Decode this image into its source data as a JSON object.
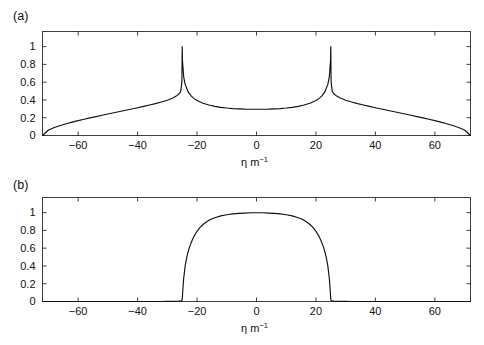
{
  "figure": {
    "width": 484,
    "height": 345,
    "background": "#ffffff",
    "line_color": "#111111",
    "axis_color": "#2b2b2b"
  },
  "panels": [
    {
      "id": "a",
      "label": "(a)",
      "xlabel_symbol": "η m",
      "xlabel_exponent": "−1",
      "xticks": [
        -60,
        -40,
        -20,
        0,
        20,
        40,
        60
      ],
      "xticklabels": [
        "−60",
        "−40",
        "−20",
        "0",
        "20",
        "40",
        "60"
      ],
      "yticks": [
        0,
        0.2,
        0.4,
        0.6,
        0.8,
        1
      ],
      "yticklabels": [
        "0",
        "0.2",
        "0.4",
        "0.6",
        "0.8",
        "1"
      ],
      "xlim": [
        -72,
        72
      ],
      "ylim": [
        0,
        1.17
      ]
    },
    {
      "id": "b",
      "label": "(b)",
      "xlabel_symbol": "η m",
      "xlabel_exponent": "−1",
      "xticks": [
        -60,
        -40,
        -20,
        0,
        20,
        40,
        60
      ],
      "xticklabels": [
        "−60",
        "−40",
        "−20",
        "0",
        "20",
        "40",
        "60"
      ],
      "yticks": [
        0,
        0.2,
        0.4,
        0.6,
        0.8,
        1
      ],
      "yticklabels": [
        "0",
        "0.2",
        "0.4",
        "0.6",
        "0.8",
        "1"
      ],
      "xlim": [
        -72,
        72
      ],
      "ylim": [
        0,
        1.17
      ]
    }
  ],
  "chart_data": [
    {
      "type": "line",
      "title": "(a)",
      "xlabel": "η m⁻¹",
      "ylabel": "",
      "xlim": [
        -72,
        72
      ],
      "ylim": [
        0,
        1.17
      ],
      "grid": false,
      "legend": null,
      "xticks": [
        -60,
        -40,
        -20,
        0,
        20,
        40,
        60
      ],
      "yticks": [
        0,
        0.2,
        0.4,
        0.6,
        0.8,
        1
      ],
      "annotations": [
        "cusp singularities at η = ±25 reaching 1",
        "zero at η = ±72",
        "central plateau near 0.30"
      ],
      "x": [
        -72,
        -70,
        -68,
        -66,
        -64,
        -62,
        -60,
        -58,
        -56,
        -54,
        -52,
        -50,
        -48,
        -46,
        -44,
        -42,
        -40,
        -38,
        -36,
        -34,
        -32,
        -30,
        -28,
        -27,
        -26,
        -25.5,
        -25.1,
        -25,
        -24.9,
        -24.5,
        -24,
        -23,
        -22,
        -21,
        -20,
        -18,
        -16,
        -14,
        -12,
        -10,
        -8,
        -6,
        -4,
        -2,
        0,
        2,
        4,
        6,
        8,
        10,
        12,
        14,
        16,
        18,
        20,
        21,
        22,
        23,
        24,
        24.5,
        24.9,
        25,
        25.1,
        25.5,
        26,
        27,
        28,
        30,
        32,
        34,
        36,
        38,
        40,
        42,
        44,
        46,
        48,
        50,
        52,
        54,
        56,
        58,
        60,
        62,
        64,
        66,
        68,
        70,
        72
      ],
      "y": [
        0,
        0.062,
        0.09,
        0.112,
        0.132,
        0.15,
        0.167,
        0.183,
        0.198,
        0.213,
        0.228,
        0.242,
        0.256,
        0.27,
        0.284,
        0.298,
        0.312,
        0.327,
        0.343,
        0.359,
        0.377,
        0.397,
        0.424,
        0.443,
        0.47,
        0.496,
        0.6,
        1.0,
        0.84,
        0.66,
        0.575,
        0.49,
        0.445,
        0.415,
        0.393,
        0.363,
        0.343,
        0.328,
        0.317,
        0.309,
        0.303,
        0.299,
        0.296,
        0.295,
        0.295,
        0.295,
        0.296,
        0.299,
        0.303,
        0.309,
        0.317,
        0.328,
        0.343,
        0.363,
        0.393,
        0.415,
        0.445,
        0.49,
        0.575,
        0.66,
        0.84,
        1.0,
        0.6,
        0.496,
        0.47,
        0.443,
        0.424,
        0.397,
        0.377,
        0.359,
        0.343,
        0.327,
        0.312,
        0.298,
        0.284,
        0.27,
        0.256,
        0.242,
        0.228,
        0.213,
        0.198,
        0.183,
        0.167,
        0.15,
        0.132,
        0.112,
        0.09,
        0.062,
        0
      ]
    },
    {
      "type": "line",
      "title": "(b)",
      "xlabel": "η m⁻¹",
      "ylabel": "",
      "xlim": [
        -72,
        72
      ],
      "ylim": [
        0,
        1.17
      ],
      "grid": false,
      "legend": null,
      "xticks": [
        -60,
        -40,
        -20,
        0,
        20,
        40,
        60
      ],
      "yticks": [
        0,
        0.2,
        0.4,
        0.6,
        0.8,
        1
      ],
      "annotations": [
        "flat-top profile, zero outside |η| > 25",
        "sharp near-vertical edges at η = ±25",
        "maximum 1 at η = 0"
      ],
      "x": [
        -72,
        -65,
        -60,
        -55,
        -50,
        -45,
        -40,
        -35,
        -32,
        -30,
        -28,
        -27,
        -26,
        -25.5,
        -25.2,
        -25,
        -24.8,
        -24.5,
        -24,
        -23.5,
        -23,
        -22.5,
        -22,
        -21.5,
        -21,
        -20,
        -19,
        -18,
        -17,
        -16,
        -15,
        -14,
        -12,
        -10,
        -8,
        -6,
        -4,
        -2,
        0,
        2,
        4,
        6,
        8,
        10,
        12,
        14,
        15,
        16,
        17,
        18,
        19,
        20,
        21,
        21.5,
        22,
        22.5,
        23,
        23.5,
        24,
        24.5,
        24.8,
        25,
        25.2,
        25.5,
        26,
        27,
        28,
        30,
        32,
        35,
        40,
        45,
        50,
        55,
        60,
        65,
        72
      ],
      "y": [
        0,
        0,
        0,
        0,
        0,
        0,
        0,
        0,
        0,
        0.001,
        0.002,
        0.003,
        0.004,
        0.006,
        0.01,
        0.02,
        0.12,
        0.26,
        0.4,
        0.49,
        0.56,
        0.615,
        0.66,
        0.7,
        0.735,
        0.79,
        0.833,
        0.866,
        0.892,
        0.913,
        0.93,
        0.943,
        0.963,
        0.976,
        0.985,
        0.991,
        0.995,
        0.998,
        0.999,
        0.998,
        0.995,
        0.991,
        0.985,
        0.976,
        0.963,
        0.943,
        0.93,
        0.913,
        0.892,
        0.866,
        0.833,
        0.79,
        0.735,
        0.7,
        0.66,
        0.615,
        0.56,
        0.49,
        0.4,
        0.26,
        0.12,
        0.02,
        0.01,
        0.006,
        0.004,
        0.003,
        0.002,
        0.001,
        0,
        0,
        0,
        0,
        0,
        0,
        0,
        0,
        0
      ]
    }
  ]
}
